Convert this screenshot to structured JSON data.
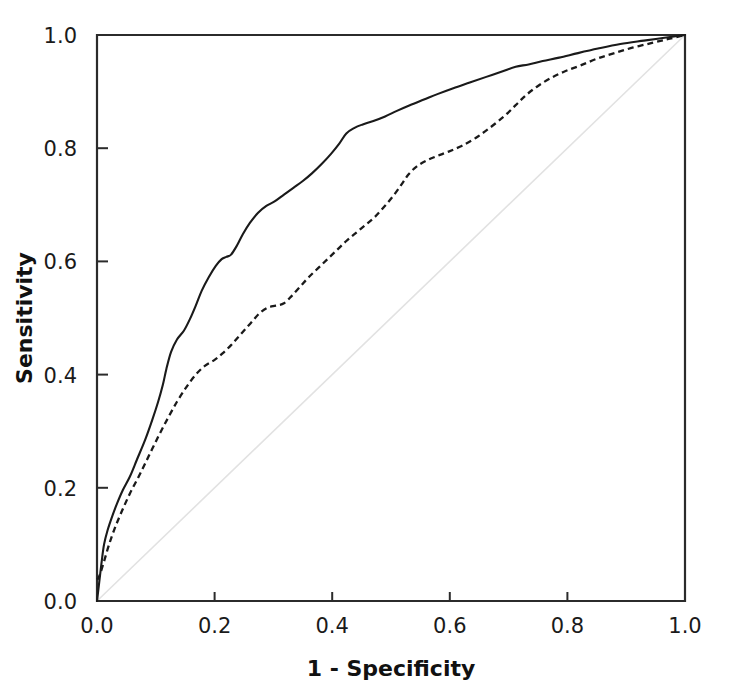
{
  "chart_data": {
    "type": "line",
    "title": "",
    "xlabel": "1 - Specificity",
    "ylabel": "Sensitivity",
    "xlim": [
      0.0,
      1.0
    ],
    "ylim": [
      0.0,
      1.0
    ],
    "grid": false,
    "legend": "none",
    "xticks": [
      "0.0",
      "0.2",
      "0.4",
      "0.6",
      "0.8",
      "1.0"
    ],
    "xtick_values": [
      0.0,
      0.2,
      0.4,
      0.6,
      0.8,
      1.0
    ],
    "yticks": [
      "0.0",
      "0.2",
      "0.4",
      "0.6",
      "0.8",
      "1.0"
    ],
    "ytick_values": [
      0.0,
      0.2,
      0.4,
      0.6,
      0.8,
      1.0
    ],
    "series": [
      {
        "name": "ROC curve 1 (solid)",
        "style": "solid",
        "color": "#1a1a1a",
        "x": [
          0.0,
          0.004,
          0.008,
          0.012,
          0.018,
          0.026,
          0.034,
          0.044,
          0.056,
          0.068,
          0.082,
          0.094,
          0.104,
          0.112,
          0.118,
          0.126,
          0.136,
          0.148,
          0.158,
          0.168,
          0.178,
          0.19,
          0.202,
          0.212,
          0.22,
          0.228,
          0.238,
          0.248,
          0.26,
          0.274,
          0.288,
          0.302,
          0.318,
          0.334,
          0.35,
          0.366,
          0.382,
          0.398,
          0.412,
          0.424,
          0.438,
          0.452,
          0.47,
          0.49,
          0.51,
          0.532,
          0.556,
          0.58,
          0.606,
          0.634,
          0.662,
          0.69,
          0.712,
          0.734,
          0.758,
          0.786,
          0.818,
          0.852,
          0.89,
          0.93,
          0.965,
          1.0
        ],
        "y": [
          0.0,
          0.035,
          0.07,
          0.1,
          0.125,
          0.15,
          0.172,
          0.196,
          0.22,
          0.25,
          0.285,
          0.32,
          0.352,
          0.382,
          0.41,
          0.44,
          0.462,
          0.478,
          0.498,
          0.522,
          0.548,
          0.572,
          0.592,
          0.604,
          0.608,
          0.612,
          0.628,
          0.648,
          0.668,
          0.686,
          0.698,
          0.706,
          0.718,
          0.73,
          0.742,
          0.756,
          0.772,
          0.79,
          0.808,
          0.826,
          0.836,
          0.842,
          0.848,
          0.856,
          0.866,
          0.876,
          0.886,
          0.896,
          0.906,
          0.916,
          0.926,
          0.936,
          0.944,
          0.948,
          0.954,
          0.96,
          0.968,
          0.976,
          0.984,
          0.99,
          0.995,
          1.0
        ]
      },
      {
        "name": "ROC curve 2 (dashed)",
        "style": "dashed",
        "color": "#1a1a1a",
        "x": [
          0.0,
          0.002,
          0.006,
          0.012,
          0.02,
          0.03,
          0.042,
          0.056,
          0.072,
          0.088,
          0.104,
          0.12,
          0.136,
          0.152,
          0.168,
          0.184,
          0.2,
          0.214,
          0.228,
          0.24,
          0.252,
          0.264,
          0.276,
          0.29,
          0.304,
          0.318,
          0.332,
          0.346,
          0.36,
          0.376,
          0.392,
          0.408,
          0.424,
          0.44,
          0.456,
          0.472,
          0.488,
          0.504,
          0.518,
          0.53,
          0.544,
          0.56,
          0.578,
          0.598,
          0.62,
          0.644,
          0.668,
          0.692,
          0.712,
          0.73,
          0.75,
          0.772,
          0.796,
          0.822,
          0.85,
          0.88,
          0.912,
          0.944,
          0.972,
          1.0
        ],
        "y": [
          0.038,
          0.04,
          0.05,
          0.07,
          0.098,
          0.128,
          0.158,
          0.19,
          0.222,
          0.256,
          0.29,
          0.322,
          0.352,
          0.378,
          0.4,
          0.416,
          0.426,
          0.438,
          0.452,
          0.466,
          0.48,
          0.494,
          0.508,
          0.518,
          0.522,
          0.526,
          0.54,
          0.556,
          0.572,
          0.588,
          0.604,
          0.62,
          0.636,
          0.65,
          0.664,
          0.678,
          0.696,
          0.716,
          0.736,
          0.754,
          0.768,
          0.778,
          0.786,
          0.794,
          0.804,
          0.818,
          0.836,
          0.856,
          0.876,
          0.894,
          0.91,
          0.924,
          0.936,
          0.946,
          0.958,
          0.968,
          0.978,
          0.986,
          0.993,
          1.0
        ]
      },
      {
        "name": "Reference diagonal",
        "style": "reference",
        "color": "#e2e2e2",
        "x": [
          0.0,
          1.0
        ],
        "y": [
          0.0,
          1.0
        ]
      }
    ]
  },
  "axis": {
    "x_title": "1 - Specificity",
    "y_title": "Sensitivity"
  }
}
